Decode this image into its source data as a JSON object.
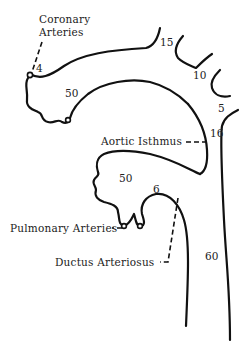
{
  "diagram": {
    "labels": {
      "coronary_arteries_line1": "Coronary",
      "coronary_arteries_line2": "Arteries",
      "aortic_isthmus": "Aortic Isthmus",
      "pulmonary_arteries": "Pulmonary Arteries",
      "ductus_arteriosus": "Ductus Arteriosus"
    },
    "values": {
      "coronary": "4",
      "ascending_aorta": "50",
      "brachiocephalic": "15",
      "left_carotid": "10",
      "left_subclavian": "5",
      "isthmus": "16",
      "pulmonary_trunk": "50",
      "pulmonary_arteries": "6",
      "descending_aorta": "60"
    },
    "colors": {
      "stroke": "#111111",
      "text": "#222222",
      "background": "#ffffff"
    }
  }
}
